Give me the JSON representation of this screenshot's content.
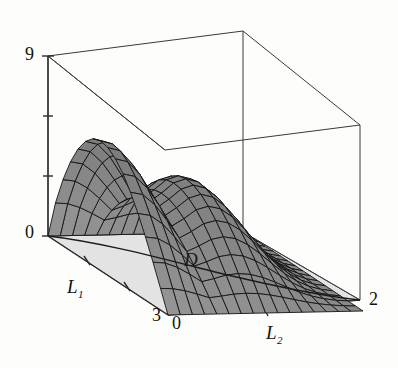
{
  "figure": {
    "type": "surface-plot-3d",
    "background_color": "#fdfdfc"
  },
  "axes": {
    "vertical": {
      "name": "z",
      "min_label": "0",
      "max_label": "9",
      "range": [
        0,
        9
      ],
      "ticks": [
        0,
        3,
        6,
        9
      ],
      "tick_labels_shown": [
        "0",
        "9"
      ]
    },
    "left": {
      "name": "L1",
      "label": "L",
      "subscript": "1",
      "min_label": "0",
      "max_label": "3",
      "range": [
        0,
        3
      ],
      "ticks": [
        0,
        1,
        2,
        3
      ],
      "tick_labels_shown": [
        "3"
      ]
    },
    "right": {
      "name": "L2",
      "label": "L",
      "subscript": "2",
      "min_label": "0",
      "max_label": "2",
      "range": [
        0,
        2
      ],
      "ticks": [
        0,
        1,
        2
      ],
      "tick_labels_shown": [
        "0",
        "2"
      ]
    }
  },
  "annotations": {
    "domain_label": "D"
  },
  "colors": {
    "mesh_fill": "#8a8a8a",
    "mesh_fill_dark": "#6f6f6f",
    "mesh_line": "#141414",
    "floor_fill": "#e3e3e3",
    "box_line": "#3a3a3a",
    "axis_line": "#2a2a2a",
    "text": "#111111"
  },
  "chart_data": {
    "type": "surface",
    "title": "",
    "xlabel": "L_1",
    "ylabel": "L_2",
    "zlabel": "",
    "xlim": [
      0,
      3
    ],
    "ylim": [
      0,
      2
    ],
    "zlim": [
      0,
      9
    ],
    "grid": false,
    "legend": false,
    "domain": {
      "label": "D",
      "L1_range": [
        0,
        3
      ],
      "L2_range": [
        0,
        2
      ]
    },
    "surface_features": [
      {
        "name": "origin-corner",
        "L1": 0,
        "L2": 0,
        "z": 0
      },
      {
        "name": "left-peak",
        "L1": 1.5,
        "L2": 0.0,
        "z": 6.2
      },
      {
        "name": "saddle-valley",
        "L1": 1.6,
        "L2": 0.55,
        "z": 5.1
      },
      {
        "name": "right-peak",
        "L1": 2.2,
        "L2": 1.0,
        "z": 6.6
      },
      {
        "name": "far-corner",
        "L1": 3.0,
        "L2": 2.0,
        "z": 0
      }
    ],
    "mesh_divisions": {
      "L1": 16,
      "L2": 16
    }
  }
}
